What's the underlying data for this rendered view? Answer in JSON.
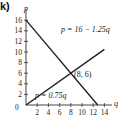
{
  "part_label": "k)",
  "chart_data": {
    "type": "line",
    "title": "",
    "xlabel": "q",
    "ylabel": "p",
    "xlim": [
      0,
      15
    ],
    "ylim": [
      0,
      17
    ],
    "x_ticks": [
      2,
      4,
      6,
      8,
      10,
      12,
      14
    ],
    "y_ticks": [
      2,
      4,
      6,
      8,
      10,
      12,
      14,
      16
    ],
    "origin_label": "0",
    "grid": false,
    "legend": null,
    "series": [
      {
        "name": "p = 16 − 1.25q",
        "equation": "p = 16 - 1.25q",
        "points": [
          [
            0,
            16
          ],
          [
            12.8,
            0
          ]
        ]
      },
      {
        "name": "p = 0.75q",
        "equation": "p = 0.75q",
        "points": [
          [
            0,
            0
          ],
          [
            14,
            10.5
          ]
        ]
      }
    ],
    "annotations": [
      {
        "text": "(8, 6)",
        "x": 8,
        "y": 6,
        "type": "intersection"
      }
    ]
  },
  "labels": {
    "demand_eq": "p = 16 − 1.25q",
    "supply_eq": "p = 0.75q",
    "intersection": "(8, 6)",
    "x_axis": "q",
    "y_axis": "p",
    "origin": "0"
  },
  "colors": {
    "line": "#1a1a1a",
    "axis": "#333333",
    "text": "#1a1a1a"
  }
}
